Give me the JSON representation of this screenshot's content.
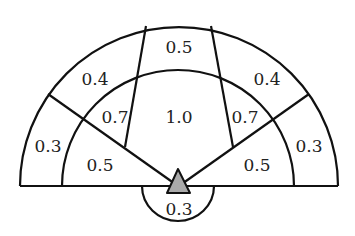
{
  "diagram": {
    "type": "semicircular zone map",
    "colors": {
      "stroke": "#111111",
      "marker_fill": "#aaaaaa",
      "background": "#ffffff",
      "text": "#222222"
    },
    "zones": [
      {
        "id": "outer-top",
        "value": "0.5"
      },
      {
        "id": "outer-upper-left",
        "value": "0.4"
      },
      {
        "id": "outer-upper-right",
        "value": "0.4"
      },
      {
        "id": "outer-left",
        "value": "0.3"
      },
      {
        "id": "outer-right",
        "value": "0.3"
      },
      {
        "id": "inner-upper-left",
        "value": "0.7"
      },
      {
        "id": "inner-center",
        "value": "1.0"
      },
      {
        "id": "inner-upper-right",
        "value": "0.7"
      },
      {
        "id": "inner-lower-left",
        "value": "0.5"
      },
      {
        "id": "inner-lower-right",
        "value": "0.5"
      },
      {
        "id": "rear",
        "value": "0.3"
      }
    ],
    "marker": {
      "shape": "triangle",
      "label": "observer position"
    }
  }
}
